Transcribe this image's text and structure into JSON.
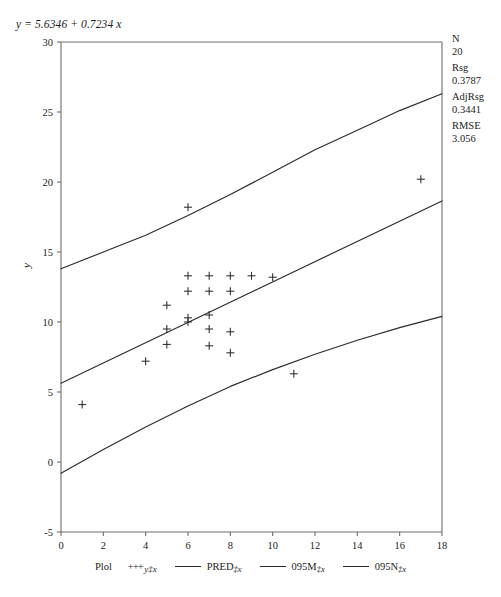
{
  "equation": "y = 5.6346 + 0.7234 x",
  "stats": [
    {
      "label": "N",
      "value": "20"
    },
    {
      "label": "Rsg",
      "value": "0.3787"
    },
    {
      "label": "AdjRsg",
      "value": "0.3441"
    },
    {
      "label": "RMSE",
      "value": "3.056"
    }
  ],
  "legend": {
    "title": "Plol",
    "items": [
      {
        "marker": "plus",
        "symbol": "+++",
        "main": "",
        "sub": "y‡x"
      },
      {
        "marker": "line",
        "symbol": "",
        "main": "PRED",
        "sub": "‡x"
      },
      {
        "marker": "line",
        "symbol": "",
        "main": "095M",
        "sub": "‡x"
      },
      {
        "marker": "line",
        "symbol": "",
        "main": "095N",
        "sub": "‡x"
      }
    ]
  },
  "chart_data": {
    "type": "scatter",
    "title": "y = 5.6346 + 0.7234 x",
    "xlabel": "",
    "ylabel": "y",
    "xlim": [
      0,
      18
    ],
    "ylim": [
      -5,
      30
    ],
    "xticks": [
      0,
      2,
      4,
      6,
      8,
      10,
      12,
      14,
      16,
      18
    ],
    "yticks": [
      -5,
      0,
      5,
      10,
      15,
      20,
      25,
      30
    ],
    "grid": false,
    "legend_position": "bottom",
    "regression": {
      "intercept": 5.6346,
      "slope": 0.7234,
      "n": 20,
      "r_squared": 0.3787,
      "adj_r_squared": 0.3441,
      "rmse": 3.056
    },
    "points": [
      {
        "x": 1,
        "y": 4.1
      },
      {
        "x": 4,
        "y": 7.2
      },
      {
        "x": 5,
        "y": 11.2
      },
      {
        "x": 5,
        "y": 9.5
      },
      {
        "x": 5,
        "y": 8.4
      },
      {
        "x": 6,
        "y": 18.2
      },
      {
        "x": 6,
        "y": 13.3
      },
      {
        "x": 6,
        "y": 12.2
      },
      {
        "x": 6,
        "y": 10.3
      },
      {
        "x": 6,
        "y": 10.0
      },
      {
        "x": 7,
        "y": 13.3
      },
      {
        "x": 7,
        "y": 12.2
      },
      {
        "x": 7,
        "y": 10.5
      },
      {
        "x": 7,
        "y": 9.5
      },
      {
        "x": 7,
        "y": 8.3
      },
      {
        "x": 8,
        "y": 13.3
      },
      {
        "x": 8,
        "y": 12.2
      },
      {
        "x": 8,
        "y": 9.3
      },
      {
        "x": 8,
        "y": 7.8
      },
      {
        "x": 9,
        "y": 13.3
      },
      {
        "x": 10,
        "y": 13.2
      },
      {
        "x": 11,
        "y": 6.3
      },
      {
        "x": 17,
        "y": 20.2
      }
    ],
    "series": [
      {
        "name": "PRED",
        "type": "line",
        "points": [
          {
            "x": 0,
            "y": 5.63
          },
          {
            "x": 18,
            "y": 18.65
          }
        ]
      },
      {
        "name": "095M",
        "type": "line",
        "points": [
          {
            "x": 0,
            "y": 13.8
          },
          {
            "x": 2,
            "y": 15.0
          },
          {
            "x": 4,
            "y": 16.2
          },
          {
            "x": 6,
            "y": 17.6
          },
          {
            "x": 8,
            "y": 19.1
          },
          {
            "x": 10,
            "y": 20.7
          },
          {
            "x": 12,
            "y": 22.3
          },
          {
            "x": 14,
            "y": 23.7
          },
          {
            "x": 16,
            "y": 25.1
          },
          {
            "x": 18,
            "y": 26.3
          }
        ]
      },
      {
        "name": "095N",
        "type": "line",
        "points": [
          {
            "x": 0,
            "y": -0.8
          },
          {
            "x": 2,
            "y": 0.9
          },
          {
            "x": 4,
            "y": 2.5
          },
          {
            "x": 6,
            "y": 4.0
          },
          {
            "x": 8,
            "y": 5.4
          },
          {
            "x": 10,
            "y": 6.6
          },
          {
            "x": 12,
            "y": 7.7
          },
          {
            "x": 14,
            "y": 8.7
          },
          {
            "x": 16,
            "y": 9.6
          },
          {
            "x": 18,
            "y": 10.4
          }
        ]
      }
    ]
  }
}
